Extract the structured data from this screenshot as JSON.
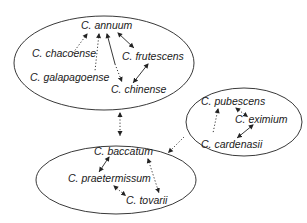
{
  "diagram": {
    "colors": {
      "stroke": "#222222",
      "text": "#1a1a1a",
      "background": "#ffffff"
    },
    "groups": [
      {
        "id": "annuum-complex",
        "species": [
          {
            "id": "annuum",
            "label": "C. annuum"
          },
          {
            "id": "chacoense",
            "label": "C. chacoense"
          },
          {
            "id": "frutescens",
            "label": "C. frutescens"
          },
          {
            "id": "galapagoense",
            "label": "C. galapagoense"
          },
          {
            "id": "chinense",
            "label": "C. chinense"
          }
        ]
      },
      {
        "id": "pubescens-complex",
        "species": [
          {
            "id": "pubescens",
            "label": "C. pubescens"
          },
          {
            "id": "eximium",
            "label": "C. eximium"
          },
          {
            "id": "cardenasii",
            "label": "C. cardenasii"
          }
        ]
      },
      {
        "id": "baccatum-complex",
        "species": [
          {
            "id": "baccatum",
            "label": "C. baccatum"
          },
          {
            "id": "praetermissum",
            "label": "C. praetermissum"
          },
          {
            "id": "tovarii",
            "label": "C. tovarii"
          }
        ]
      }
    ],
    "edges": [
      {
        "from": "annuum",
        "to": "chacoense",
        "style": "dotted"
      },
      {
        "from": "annuum",
        "to": "galapagoense",
        "style": "dotted"
      },
      {
        "from": "annuum",
        "to": "chinense",
        "style": "solid-to-dotted"
      },
      {
        "from": "annuum",
        "to": "frutescens",
        "style": "solid"
      },
      {
        "from": "frutescens",
        "to": "chinense",
        "style": "solid"
      },
      {
        "from": "pubescens",
        "to": "cardenasii",
        "style": "dotted"
      },
      {
        "from": "pubescens",
        "to": "eximium",
        "style": "dotted"
      },
      {
        "from": "eximium",
        "to": "cardenasii",
        "style": "solid"
      },
      {
        "from": "baccatum",
        "to": "praetermissum",
        "style": "solid"
      },
      {
        "from": "baccatum",
        "to": "tovarii",
        "style": "dotted"
      },
      {
        "from": "praetermissum",
        "to": "tovarii",
        "style": "dotted"
      },
      {
        "from": "annuum-complex",
        "to": "baccatum-complex",
        "style": "dotted"
      },
      {
        "from": "pubescens-complex",
        "to": "baccatum-complex",
        "style": "dotted"
      }
    ]
  }
}
